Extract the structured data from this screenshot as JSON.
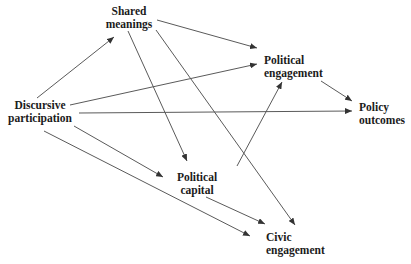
{
  "diagram": {
    "type": "path-diagram",
    "background_color": "#ffffff",
    "text_color": "#1b1b1b",
    "line_color": "#5a5a5a",
    "arrow_color": "#333333",
    "nodes": [
      {
        "id": "shared-meanings",
        "label": "Shared meanings",
        "lines": [
          "Shared",
          "meanings"
        ],
        "x": 95,
        "y": 5,
        "width": 68,
        "align": "center"
      },
      {
        "id": "political-engagement",
        "label": "Political engagement",
        "lines": [
          "Political",
          "engagement"
        ],
        "x": 264,
        "y": 54,
        "width": 72,
        "align": "left"
      },
      {
        "id": "policy-outcomes",
        "label": "Policy outcomes",
        "lines": [
          "Policy",
          "outcomes"
        ],
        "x": 359,
        "y": 101,
        "width": 52,
        "align": "left"
      },
      {
        "id": "discursive-participation",
        "label": "Discursive participation",
        "lines": [
          "Discursive",
          "participation"
        ],
        "x": 0,
        "y": 99,
        "width": 80,
        "align": "center"
      },
      {
        "id": "political-capital",
        "label": "Political capital",
        "lines": [
          "Political",
          "capital"
        ],
        "x": 167,
        "y": 171,
        "width": 60,
        "align": "center"
      },
      {
        "id": "civic-engagement",
        "label": "Civic engagement",
        "lines": [
          "Civic",
          "engagement"
        ],
        "x": 266,
        "y": 231,
        "width": 62,
        "align": "left"
      }
    ],
    "edges": [
      {
        "from": "discursive-participation",
        "to": "shared-meanings",
        "x1": 37,
        "y1": 98,
        "x2": 114,
        "y2": 37
      },
      {
        "from": "discursive-participation",
        "to": "political-engagement",
        "x1": 70,
        "y1": 105,
        "x2": 257,
        "y2": 64
      },
      {
        "from": "discursive-participation",
        "to": "policy-outcomes",
        "x1": 79,
        "y1": 113,
        "x2": 352,
        "y2": 111
      },
      {
        "from": "discursive-participation",
        "to": "political-capital",
        "x1": 74,
        "y1": 126,
        "x2": 163,
        "y2": 177
      },
      {
        "from": "discursive-participation",
        "to": "civic-engagement",
        "x1": 44,
        "y1": 131,
        "x2": 250,
        "y2": 236
      },
      {
        "from": "shared-meanings",
        "to": "political-engagement",
        "x1": 157,
        "y1": 20,
        "x2": 257,
        "y2": 48
      },
      {
        "from": "shared-meanings",
        "to": "political-capital",
        "x1": 128,
        "y1": 31,
        "x2": 187,
        "y2": 161
      },
      {
        "from": "shared-meanings",
        "to": "civic-engagement",
        "x1": 156,
        "y1": 30,
        "x2": 295,
        "y2": 225
      },
      {
        "from": "political-engagement",
        "to": "policy-outcomes",
        "x1": 321,
        "y1": 81,
        "x2": 352,
        "y2": 101
      },
      {
        "from": "political-capital",
        "to": "political-engagement",
        "x1": 237,
        "y1": 166,
        "x2": 282,
        "y2": 82
      },
      {
        "from": "political-capital",
        "to": "civic-engagement",
        "x1": 206,
        "y1": 197,
        "x2": 265,
        "y2": 224
      }
    ]
  }
}
